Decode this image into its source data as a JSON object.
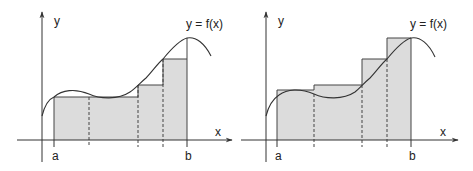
{
  "colors": {
    "background": "#ffffff",
    "fill": "#dcdcdc",
    "stroke": "#333333"
  },
  "panels": [
    {
      "id": "lower-sum",
      "y_axis_label": "y",
      "x_axis_label": "x",
      "curve_label": "y = f(x)",
      "a_label": "a",
      "b_label": "b",
      "description": "Rectangles inscribed under the curve (lower Riemann sum)"
    },
    {
      "id": "upper-sum",
      "y_axis_label": "y",
      "x_axis_label": "x",
      "curve_label": "y = f(x)",
      "a_label": "a",
      "b_label": "b",
      "description": "Rectangles circumscribed over the curve (upper Riemann sum)"
    }
  ]
}
